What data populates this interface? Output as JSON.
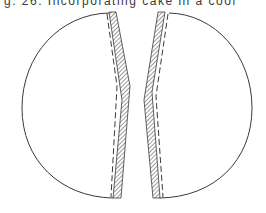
{
  "figure": {
    "caption": "g. 26.  Incorporating cake in a cool",
    "colors": {
      "background": "#ffffff",
      "ink": "#3a3a3a"
    },
    "parts": [
      {
        "name": "left-half",
        "label": ""
      },
      {
        "name": "right-half",
        "label": ""
      }
    ]
  }
}
